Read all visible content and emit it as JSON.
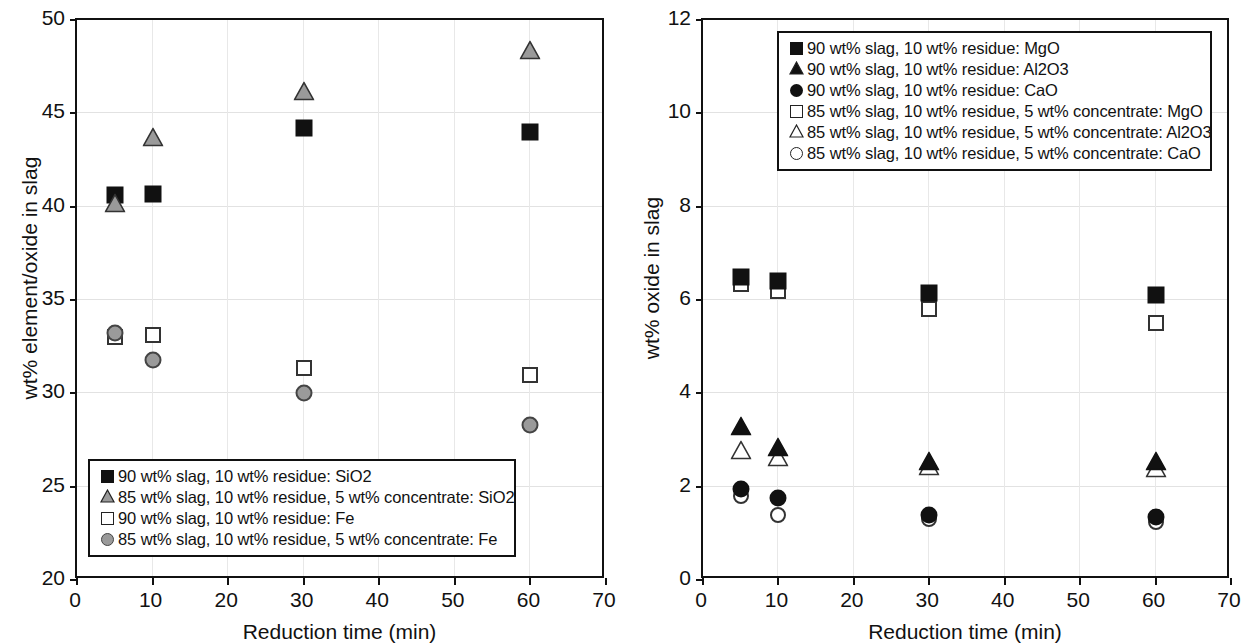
{
  "chart_data": [
    {
      "panel": "left",
      "type": "scatter",
      "title": "",
      "xlabel": "Reduction time (min)",
      "ylabel": "wt% element/oxide in slag",
      "xlim": [
        0,
        70
      ],
      "ylim": [
        20,
        50
      ],
      "xticks": [
        "0",
        "10",
        "20",
        "30",
        "40",
        "50",
        "60",
        "70"
      ],
      "yticks": [
        "20",
        "25",
        "30",
        "35",
        "40",
        "45",
        "50"
      ],
      "grid": true,
      "legend_position": "bottom-left",
      "series": [
        {
          "name": "90 wt% slag, 10 wt% residue: SiO2",
          "marker": "square-filled",
          "x": [
            5,
            10,
            30,
            60
          ],
          "values": [
            40.6,
            40.7,
            44.2,
            44.0
          ]
        },
        {
          "name": "85 wt% slag, 10 wt% residue, 5 wt% concentrate: SiO2",
          "marker": "triangle-grey",
          "x": [
            5,
            10,
            30,
            60
          ],
          "values": [
            40.1,
            43.6,
            46.1,
            48.3
          ]
        },
        {
          "name": "90 wt% slag, 10 wt% residue: Fe",
          "marker": "square-open",
          "x": [
            5,
            10,
            30,
            60
          ],
          "values": [
            33.0,
            33.1,
            31.35,
            31.0
          ]
        },
        {
          "name": "85 wt% slag, 10 wt% residue, 5 wt% concentrate: Fe",
          "marker": "circle-grey",
          "x": [
            5,
            10,
            30,
            60
          ],
          "values": [
            33.25,
            31.8,
            30.0,
            28.3
          ]
        }
      ]
    },
    {
      "panel": "right",
      "type": "scatter",
      "title": "",
      "xlabel": "Reduction time (min)",
      "ylabel": "wt% oxide in slag",
      "xlim": [
        0,
        70
      ],
      "ylim": [
        0,
        12
      ],
      "xticks": [
        "0",
        "10",
        "20",
        "30",
        "40",
        "50",
        "60",
        "70"
      ],
      "yticks": [
        "0",
        "2",
        "4",
        "6",
        "8",
        "10",
        "12"
      ],
      "grid": true,
      "legend_position": "top-center",
      "series": [
        {
          "name": "90 wt% slag, 10 wt% residue: MgO",
          "marker": "square-filled",
          "x": [
            5,
            10,
            30,
            60
          ],
          "values": [
            6.5,
            6.4,
            6.15,
            6.1
          ]
        },
        {
          "name": "90 wt% slag, 10 wt% residue: Al2O3",
          "marker": "triangle-filled",
          "x": [
            5,
            10,
            30,
            60
          ],
          "values": [
            3.25,
            2.8,
            2.5,
            2.5
          ]
        },
        {
          "name": "90 wt% slag, 10 wt% residue: CaO",
          "marker": "circle-filled",
          "x": [
            5,
            10,
            30,
            60
          ],
          "values": [
            1.95,
            1.75,
            1.4,
            1.35
          ]
        },
        {
          "name": "85 wt% slag, 10 wt% residue, 5 wt% concentrate: MgO",
          "marker": "square-open",
          "x": [
            5,
            10,
            30,
            60
          ],
          "values": [
            6.35,
            6.2,
            5.8,
            5.5
          ]
        },
        {
          "name": "85 wt% slag, 10 wt% residue, 5 wt% concentrate: Al2O3",
          "marker": "triangle-open",
          "x": [
            5,
            10,
            30,
            60
          ],
          "values": [
            2.75,
            2.6,
            2.4,
            2.35
          ]
        },
        {
          "name": "85 wt% slag, 10 wt% residue, 5 wt% concentrate: CaO",
          "marker": "circle-open",
          "x": [
            5,
            10,
            30,
            60
          ],
          "values": [
            1.8,
            1.4,
            1.3,
            1.25
          ]
        }
      ]
    }
  ],
  "left": {
    "ylabel": "wt% element/oxide in slag",
    "xlabel": "Reduction time (min)",
    "yticks": [
      "50",
      "45",
      "40",
      "35",
      "30",
      "25",
      "20"
    ],
    "xticks": [
      "0",
      "10",
      "20",
      "30",
      "40",
      "50",
      "60",
      "70"
    ],
    "legend": [
      "90 wt% slag, 10 wt% residue: SiO2",
      "85 wt% slag, 10 wt% residue, 5 wt% concentrate: SiO2",
      "90 wt% slag, 10 wt% residue: Fe",
      "85 wt% slag, 10 wt% residue, 5 wt% concentrate: Fe"
    ]
  },
  "right": {
    "ylabel": "wt% oxide in slag",
    "xlabel": "Reduction time (min)",
    "yticks": [
      "12",
      "10",
      "8",
      "6",
      "4",
      "2",
      "0"
    ],
    "xticks": [
      "0",
      "10",
      "20",
      "30",
      "40",
      "50",
      "60",
      "70"
    ],
    "legend": [
      "90 wt% slag, 10 wt% residue: MgO",
      "90 wt% slag, 10 wt% residue: Al2O3",
      "90 wt% slag, 10 wt% residue: CaO",
      "85 wt% slag, 10 wt% residue, 5 wt% concentrate: MgO",
      "85 wt% slag, 10 wt% residue, 5 wt% concentrate: Al2O3",
      "85 wt% slag, 10 wt% residue, 5 wt% concentrate: CaO"
    ]
  }
}
